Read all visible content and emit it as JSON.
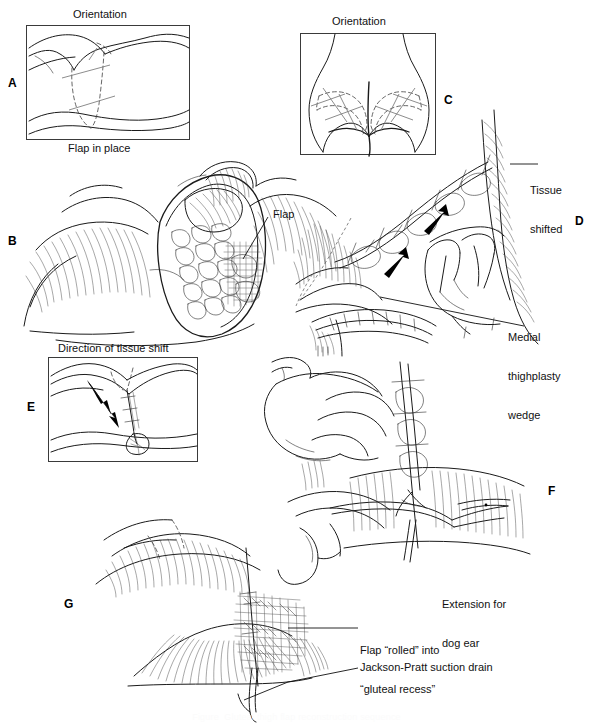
{
  "figure": {
    "kind": "medical-surgical-illustration",
    "panel_count": 7,
    "bottom_caption": "Figure  Gluteal thigh flap reconstruction sequence",
    "panels": [
      {
        "id": "A",
        "letter": "A",
        "title": "Orientation",
        "framed": true,
        "description": "Lateral decubitus body outline with dashed flap outline markings on the thigh"
      },
      {
        "id": "B",
        "letter": "B",
        "title": "Flap in place",
        "framed": false,
        "description": "Open wound cavity with flap inset, cut edge and subcutaneous tissue shown",
        "callouts": [
          "Flap"
        ]
      },
      {
        "id": "C",
        "letter": "C",
        "title": "Orientation",
        "framed": true,
        "description": "Posterior view of buttocks with bilateral dashed flap design markings"
      },
      {
        "id": "D",
        "letter": "D",
        "title": "",
        "framed": false,
        "description": "Surgeon's hand advancing the closed suture line with direction arrows",
        "callouts": [
          "Tissue shifted",
          "Medial thighplasty wedge"
        ]
      },
      {
        "id": "E",
        "letter": "E",
        "title": "Direction of tissue shift",
        "framed": true,
        "description": "Inset showing arrow indicating direction of tissue shift along the closure"
      },
      {
        "id": "F",
        "letter": "F",
        "title": "",
        "framed": false,
        "description": "Two hands with forceps extending the incision to excise a dog ear",
        "callouts": [
          "Extension for dog ear"
        ]
      },
      {
        "id": "G",
        "letter": "G",
        "title": "",
        "framed": false,
        "description": "Final closure with flap rolled into the gluteal recess and suction drain exiting",
        "callouts": [
          "Flap \"rolled\" into \"gluteal recess\"",
          "Jackson-Pratt suction drain"
        ]
      }
    ]
  },
  "labels": {
    "orientation_a": "Orientation",
    "orientation_c": "Orientation",
    "flap_in_place": "Flap in place",
    "flap": "Flap",
    "tissue_shifted_line1": "Tissue",
    "tissue_shifted_line2": "shifted",
    "medial_line1": "Medial",
    "medial_line2": "thighplasty",
    "medial_line3": "wedge",
    "direction_of_tissue_shift": "Direction of tissue shift",
    "extension_line1": "Extension for",
    "extension_line2": "dog ear",
    "flap_rolled_line1": "Flap “rolled” into",
    "flap_rolled_line2": "“gluteal recess”",
    "jackson_pratt": "Jackson-Pratt suction drain"
  },
  "panel_letters": {
    "a": "A",
    "b": "B",
    "c": "C",
    "d": "D",
    "e": "E",
    "f": "F",
    "g": "G"
  },
  "colors": {
    "background": "#ffffff",
    "ink": "#1a1a1a",
    "frame": "#3a3a3a",
    "dashed_marking": "#4a4a4a",
    "text": "#111111",
    "arrow_fill": "#000000"
  }
}
